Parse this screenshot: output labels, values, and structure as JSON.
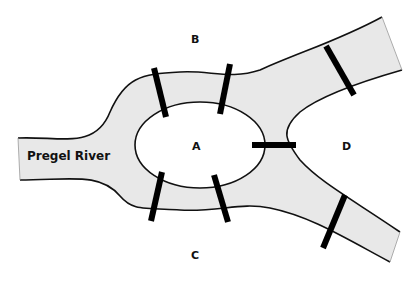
{
  "diagram": {
    "river_label": "Pregel River",
    "land_masses": [
      {
        "id": "A",
        "label": "A",
        "type": "island"
      },
      {
        "id": "B",
        "label": "B",
        "type": "north bank"
      },
      {
        "id": "C",
        "label": "C",
        "type": "south bank"
      },
      {
        "id": "D",
        "label": "D",
        "type": "east land"
      }
    ],
    "bridges": [
      {
        "id": 1,
        "connects": [
          "A",
          "B"
        ]
      },
      {
        "id": 2,
        "connects": [
          "A",
          "B"
        ]
      },
      {
        "id": 3,
        "connects": [
          "A",
          "C"
        ]
      },
      {
        "id": 4,
        "connects": [
          "A",
          "C"
        ]
      },
      {
        "id": 5,
        "connects": [
          "A",
          "D"
        ]
      },
      {
        "id": 6,
        "connects": [
          "B",
          "D"
        ]
      },
      {
        "id": 7,
        "connects": [
          "C",
          "D"
        ]
      }
    ],
    "colors": {
      "water": "#e8e8e8",
      "outline": "#111111",
      "bridge": "#000000",
      "land": "#ffffff"
    }
  }
}
